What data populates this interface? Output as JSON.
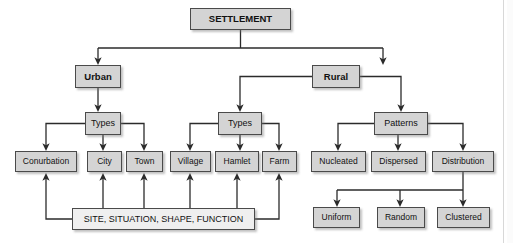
{
  "diagram": {
    "colors": {
      "box_fill": "#d4d4d4",
      "box_fill_light": "#efefef",
      "box_border": "#4a4a4a",
      "line": "#2b2b2b",
      "background": "#ffffff"
    },
    "nodes": [
      {
        "id": "settlement",
        "label": "SETTLEMENT",
        "x": 190,
        "y": 8,
        "w": 101,
        "h": 22,
        "fill": "#d4d4d4",
        "bold": true,
        "font": 9.5,
        "level": 0
      },
      {
        "id": "urban",
        "label": "Urban",
        "x": 75,
        "y": 65,
        "w": 46,
        "h": 23,
        "fill": "#d4d4d4",
        "bold": true,
        "font": 9.5,
        "level": 1
      },
      {
        "id": "rural",
        "label": "Rural",
        "x": 312,
        "y": 65,
        "w": 48,
        "h": 23,
        "fill": "#d4d4d4",
        "bold": true,
        "font": 9.5,
        "level": 1
      },
      {
        "id": "urban-types",
        "label": "Types",
        "x": 85,
        "y": 112,
        "w": 36,
        "h": 23,
        "fill": "#d4d4d4",
        "bold": false,
        "font": 9,
        "level": 2
      },
      {
        "id": "rural-types",
        "label": "Types",
        "x": 218,
        "y": 112,
        "w": 44,
        "h": 23,
        "fill": "#d4d4d4",
        "bold": false,
        "font": 9,
        "level": 2
      },
      {
        "id": "patterns",
        "label": "Patterns",
        "x": 374,
        "y": 112,
        "w": 54,
        "h": 23,
        "fill": "#d4d4d4",
        "bold": false,
        "font": 9,
        "level": 2
      },
      {
        "id": "conurbation",
        "label": "Conurbation",
        "x": 15,
        "y": 151,
        "w": 62,
        "h": 21,
        "fill": "#d4d4d4",
        "bold": false,
        "font": 8.5,
        "level": 3
      },
      {
        "id": "city",
        "label": "City",
        "x": 87,
        "y": 151,
        "w": 35,
        "h": 21,
        "fill": "#d4d4d4",
        "bold": false,
        "font": 8.5,
        "level": 3
      },
      {
        "id": "town",
        "label": "Town",
        "x": 126,
        "y": 151,
        "w": 37,
        "h": 21,
        "fill": "#d4d4d4",
        "bold": false,
        "font": 8.5,
        "level": 3
      },
      {
        "id": "village",
        "label": "Village",
        "x": 170,
        "y": 151,
        "w": 41,
        "h": 21,
        "fill": "#d4d4d4",
        "bold": false,
        "font": 8.5,
        "level": 3
      },
      {
        "id": "hamlet",
        "label": "Hamlet",
        "x": 215,
        "y": 151,
        "w": 44,
        "h": 21,
        "fill": "#d4d4d4",
        "bold": false,
        "font": 8.5,
        "level": 3
      },
      {
        "id": "farm",
        "label": "Farm",
        "x": 262,
        "y": 151,
        "w": 35,
        "h": 21,
        "fill": "#d4d4d4",
        "bold": false,
        "font": 8.5,
        "level": 3
      },
      {
        "id": "nucleated",
        "label": "Nucleated",
        "x": 311,
        "y": 151,
        "w": 55,
        "h": 21,
        "fill": "#d4d4d4",
        "bold": false,
        "font": 8.5,
        "level": 3
      },
      {
        "id": "dispersed",
        "label": "Dispersed",
        "x": 371,
        "y": 151,
        "w": 55,
        "h": 21,
        "fill": "#d4d4d4",
        "bold": false,
        "font": 8.5,
        "level": 3
      },
      {
        "id": "distribution",
        "label": "Distribution",
        "x": 432,
        "y": 151,
        "w": 62,
        "h": 21,
        "fill": "#d4d4d4",
        "bold": false,
        "font": 8.5,
        "level": 3
      },
      {
        "id": "site",
        "label": "SITE, SITUATION, SHAPE, FUNCTION",
        "x": 72,
        "y": 208,
        "w": 183,
        "h": 22,
        "fill": "#efefef",
        "bold": false,
        "font": 9,
        "level": 4
      },
      {
        "id": "uniform",
        "label": "Uniform",
        "x": 313,
        "y": 207,
        "w": 47,
        "h": 21,
        "fill": "#d4d4d4",
        "bold": false,
        "font": 8.5,
        "level": 4
      },
      {
        "id": "random",
        "label": "Random",
        "x": 377,
        "y": 207,
        "w": 48,
        "h": 21,
        "fill": "#d4d4d4",
        "bold": false,
        "font": 8.5,
        "level": 4
      },
      {
        "id": "clustered",
        "label": "Clustered",
        "x": 437,
        "y": 207,
        "w": 53,
        "h": 21,
        "fill": "#d4d4d4",
        "bold": false,
        "font": 8.5,
        "level": 4
      }
    ],
    "edges": [
      {
        "from": "settlement",
        "to": "urban",
        "kind": "split"
      },
      {
        "from": "settlement",
        "to": "rural",
        "kind": "split"
      },
      {
        "from": "urban",
        "to": "urban-types",
        "kind": "straight"
      },
      {
        "from": "rural",
        "to": "rural-types",
        "kind": "elbow"
      },
      {
        "from": "rural",
        "to": "patterns",
        "kind": "elbow"
      },
      {
        "from": "urban-types",
        "to": "conurbation",
        "kind": "split"
      },
      {
        "from": "urban-types",
        "to": "city",
        "kind": "straight"
      },
      {
        "from": "urban-types",
        "to": "town",
        "kind": "split"
      },
      {
        "from": "rural-types",
        "to": "village",
        "kind": "split"
      },
      {
        "from": "rural-types",
        "to": "hamlet",
        "kind": "straight"
      },
      {
        "from": "rural-types",
        "to": "farm",
        "kind": "split"
      },
      {
        "from": "patterns",
        "to": "nucleated",
        "kind": "split"
      },
      {
        "from": "patterns",
        "to": "dispersed",
        "kind": "straight"
      },
      {
        "from": "patterns",
        "to": "distribution",
        "kind": "split"
      },
      {
        "from": "distribution",
        "to": "uniform",
        "kind": "split"
      },
      {
        "from": "distribution",
        "to": "random",
        "kind": "split"
      },
      {
        "from": "distribution",
        "to": "clustered",
        "kind": "straight"
      },
      {
        "from": "site",
        "to": "conurbation",
        "kind": "upward"
      },
      {
        "from": "site",
        "to": "city",
        "kind": "upward"
      },
      {
        "from": "site",
        "to": "town",
        "kind": "upward"
      },
      {
        "from": "site",
        "to": "village",
        "kind": "upward"
      },
      {
        "from": "site",
        "to": "hamlet",
        "kind": "upward"
      },
      {
        "from": "site",
        "to": "farm",
        "kind": "upward"
      }
    ]
  }
}
